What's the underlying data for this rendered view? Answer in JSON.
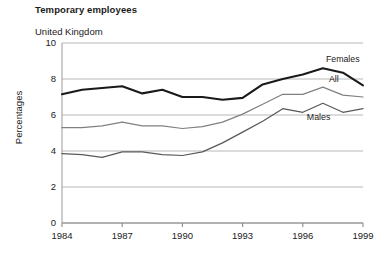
{
  "chart_data": {
    "type": "line",
    "title": "Temporary employees",
    "subtitle": "United Kingdom",
    "xlabel": "",
    "ylabel": "Percentages",
    "x": [
      1984,
      1985,
      1986,
      1987,
      1988,
      1989,
      1990,
      1991,
      1992,
      1993,
      1994,
      1995,
      1996,
      1997,
      1998,
      1999
    ],
    "xlim": [
      1984,
      1999
    ],
    "ylim": [
      0,
      10
    ],
    "xticks": [
      1984,
      1987,
      1990,
      1993,
      1996,
      1999
    ],
    "xtick_labels": [
      "1984",
      "1987",
      "1990",
      "1993",
      "1996",
      "1999"
    ],
    "yticks": [
      0,
      2,
      4,
      6,
      8,
      10
    ],
    "ytick_labels": [
      "0",
      "2",
      "4",
      "6",
      "8",
      "10"
    ],
    "grid": "horizontal",
    "legend_position": "inline-right",
    "series": [
      {
        "name": "Females",
        "color": "#1a1a1a",
        "width": 2.1,
        "label_x": 1997.15,
        "label_y": 8.95,
        "values": [
          7.15,
          7.4,
          7.5,
          7.6,
          7.2,
          7.4,
          7.0,
          7.0,
          6.85,
          6.95,
          7.7,
          8.0,
          8.25,
          8.6,
          8.35,
          7.65
        ]
      },
      {
        "name": "All",
        "color": "#808080",
        "width": 1.25,
        "label_x": 1997.3,
        "label_y": 7.85,
        "values": [
          5.3,
          5.3,
          5.4,
          5.6,
          5.4,
          5.4,
          5.25,
          5.35,
          5.6,
          6.05,
          6.6,
          7.15,
          7.15,
          7.55,
          7.1,
          7.0
        ]
      },
      {
        "name": "Males",
        "color": "#595959",
        "width": 1.25,
        "label_x": 1996.2,
        "label_y": 5.75,
        "values": [
          3.85,
          3.8,
          3.65,
          3.95,
          3.95,
          3.8,
          3.75,
          3.95,
          4.45,
          5.05,
          5.65,
          6.35,
          6.15,
          6.65,
          6.15,
          6.35
        ]
      }
    ]
  },
  "plot_geometry": {
    "left": 62,
    "right": 363,
    "top": 43,
    "bottom": 223
  }
}
